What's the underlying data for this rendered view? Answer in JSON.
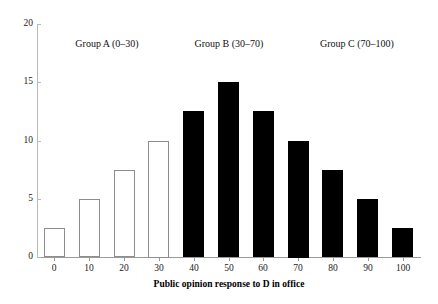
{
  "chart_data": {
    "type": "bar",
    "title": "",
    "xlabel": "Public opinion response to D in office",
    "ylabel": "",
    "categories": [
      "0",
      "10",
      "20",
      "30",
      "40",
      "50",
      "60",
      "70",
      "80",
      "90",
      "100"
    ],
    "values": [
      2.5,
      5,
      7.5,
      10,
      12.5,
      15,
      12.5,
      10,
      7.5,
      5,
      2.5
    ],
    "bar_styles": [
      "open",
      "open",
      "open",
      "open",
      "filled",
      "filled",
      "filled",
      "filled",
      "filled",
      "filled",
      "filled"
    ],
    "ylim": [
      0,
      20
    ],
    "y_ticks": [
      "0",
      "5",
      "10",
      "15",
      "20"
    ],
    "y_tick_values": [
      0,
      5,
      10,
      15,
      20
    ],
    "xlim": [
      -5,
      105
    ],
    "grid": false,
    "legend": "none",
    "colors": {
      "open_bar_fill": "#ffffff",
      "open_bar_stroke": "#8d8d8d",
      "filled_bar_fill": "#000000",
      "axis": "#9a9a9a",
      "text": "#111111",
      "background": "#ffffff"
    },
    "annotations": [
      {
        "text": "Group A (0–30)",
        "x": 15,
        "y": 18.3
      },
      {
        "text": "Group B (30–70)",
        "x": 50,
        "y": 18.3
      },
      {
        "text": "Group C (70–100)",
        "x": 87,
        "y": 18.3
      }
    ]
  }
}
